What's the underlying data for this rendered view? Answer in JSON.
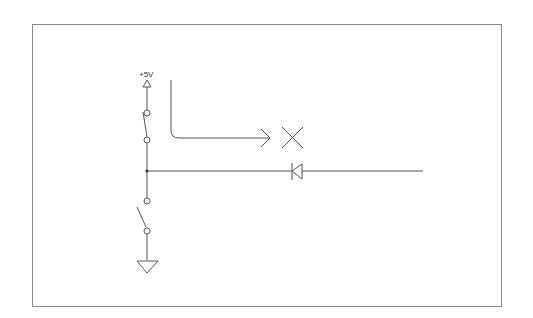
{
  "diagram": {
    "type": "circuit-schematic",
    "supply_label": "+5V",
    "stroke_color": "#555555",
    "frame_color": "#888888",
    "components": [
      {
        "id": "supply",
        "kind": "power-supply-arrow",
        "label": "+5V"
      },
      {
        "id": "sw_upper",
        "kind": "switch"
      },
      {
        "id": "junction",
        "kind": "junction-node"
      },
      {
        "id": "sw_lower",
        "kind": "switch"
      },
      {
        "id": "ground",
        "kind": "ground-symbol"
      },
      {
        "id": "diode",
        "kind": "diode",
        "orientation": "cathode-left"
      },
      {
        "id": "flow_arrow",
        "kind": "bent-arrow"
      },
      {
        "id": "blocked",
        "kind": "x-mark"
      }
    ]
  }
}
